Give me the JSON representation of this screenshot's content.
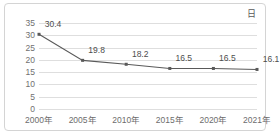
{
  "legend": {
    "label": "日"
  },
  "chart_data": {
    "type": "line",
    "title": "",
    "xlabel": "",
    "ylabel": "",
    "categories": [
      "2000年",
      "2005年",
      "2010年",
      "2015年",
      "2020年",
      "2021年"
    ],
    "values": [
      30.4,
      19.8,
      18.2,
      16.5,
      16.5,
      16.1
    ],
    "data_labels": [
      "30.4",
      "19.8",
      "18.2",
      "16.5",
      "16.5",
      "16.1"
    ],
    "series": [
      {
        "name": "日",
        "values": [
          30.4,
          19.8,
          18.2,
          16.5,
          16.5,
          16.1
        ]
      }
    ],
    "ylim": [
      0,
      35
    ],
    "ytick_step": 5,
    "ytick_labels": [
      "0",
      "5",
      "10",
      "15",
      "20",
      "25",
      "30",
      "35"
    ],
    "ytick_values": [
      0,
      5,
      10,
      15,
      20,
      25,
      30,
      35
    ],
    "grid": true,
    "legend_position": "top-right",
    "line_color": "#595959",
    "marker": "square",
    "marker_color": "#595959",
    "grid_color": "#dedede",
    "border_color": "#d4d4d4",
    "background": "#ffffff"
  }
}
